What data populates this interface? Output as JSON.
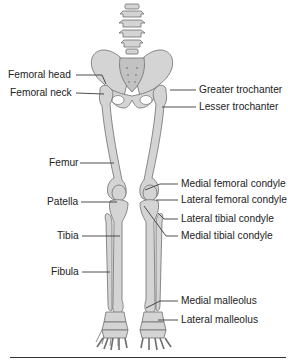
{
  "figure": {
    "colors": {
      "bone_fill": "#d4d4d4",
      "bone_stroke": "#6e6e6e",
      "label_text": "#222222",
      "leader": "#3a3a3a"
    }
  },
  "labels_left": [
    {
      "id": "femoral-head",
      "text": "Femoral head",
      "x": 8,
      "y": 69
    },
    {
      "id": "femoral-neck",
      "text": "Femoral neck",
      "x": 10,
      "y": 87
    },
    {
      "id": "femur",
      "text": "Femur",
      "x": 49,
      "y": 157
    },
    {
      "id": "patella",
      "text": "Patella",
      "x": 47,
      "y": 196
    },
    {
      "id": "tibia",
      "text": "Tibia",
      "x": 57,
      "y": 230
    },
    {
      "id": "fibula",
      "text": "Fibula",
      "x": 51,
      "y": 266
    }
  ],
  "labels_right": [
    {
      "id": "greater-trochanter",
      "text": "Greater trochanter",
      "x": 199,
      "y": 84
    },
    {
      "id": "lesser-trochanter",
      "text": "Lesser trochanter",
      "x": 199,
      "y": 101
    },
    {
      "id": "medial-femoral-condyle",
      "text": "Medial femoral condyle",
      "x": 181,
      "y": 178
    },
    {
      "id": "lateral-femoral-condyle",
      "text": "Lateral femoral condyle",
      "x": 181,
      "y": 194
    },
    {
      "id": "lateral-tibial-condyle",
      "text": "Lateral tibial condyle",
      "x": 181,
      "y": 213
    },
    {
      "id": "medial-tibial-condyle",
      "text": "Medial tibial condyle",
      "x": 181,
      "y": 230
    },
    {
      "id": "medial-malleolus",
      "text": "Medial malleolus",
      "x": 181,
      "y": 295
    },
    {
      "id": "lateral-malleolus",
      "text": "Lateral malleolus",
      "x": 181,
      "y": 314
    }
  ]
}
